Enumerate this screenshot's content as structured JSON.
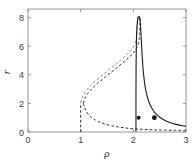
{
  "figure": {
    "background_color": "#ffffff",
    "frame_color": "#8a8a8a"
  },
  "chart_data": {
    "type": "line",
    "title": "",
    "subtitle": "",
    "xlabel": "ρ",
    "ylabel": "r",
    "xlim": [
      0,
      3
    ],
    "ylim": [
      0,
      8.6
    ],
    "xticks": [
      0,
      1,
      2,
      3
    ],
    "xtick_labels": [
      "0",
      "1",
      "2",
      "3"
    ],
    "yticks": [
      0,
      2,
      4,
      6,
      8
    ],
    "ytick_labels": [
      "0",
      "2",
      "4",
      "6",
      "8"
    ],
    "grid": false,
    "legend": null,
    "legend_position": "none",
    "colors": {
      "solid_curve": "#1a1a1a",
      "dashed_curve": "#2e2e2e",
      "dashed_curve_faint": "#7a7a7a",
      "marker": "#111111"
    },
    "series": [
      {
        "name": "upper-unstable-branch",
        "style": "dashed",
        "color": "#2e2e2e",
        "points": [
          [
            1.05,
            2.0
          ],
          [
            1.08,
            2.35
          ],
          [
            1.12,
            2.62
          ],
          [
            1.18,
            2.9
          ],
          [
            1.26,
            3.2
          ],
          [
            1.36,
            3.52
          ],
          [
            1.47,
            3.86
          ],
          [
            1.58,
            4.18
          ],
          [
            1.69,
            4.5
          ],
          [
            1.8,
            4.84
          ],
          [
            1.9,
            5.16
          ],
          [
            1.99,
            5.48
          ],
          [
            2.05,
            5.8
          ],
          [
            2.09,
            6.12
          ],
          [
            2.11,
            6.45
          ],
          [
            2.12,
            6.8
          ],
          [
            2.125,
            7.2
          ],
          [
            2.13,
            7.65
          ],
          [
            2.13,
            8.05
          ]
        ]
      },
      {
        "name": "upper-unstable-branch-secondary",
        "style": "dashed",
        "color": "#7a7a7a",
        "points": [
          [
            1.0,
            2.05
          ],
          [
            1.03,
            2.4
          ],
          [
            1.07,
            2.7
          ],
          [
            1.13,
            3.0
          ],
          [
            1.21,
            3.32
          ],
          [
            1.31,
            3.66
          ],
          [
            1.42,
            4.0
          ],
          [
            1.53,
            4.34
          ],
          [
            1.64,
            4.66
          ],
          [
            1.75,
            5.0
          ],
          [
            1.85,
            5.32
          ],
          [
            1.94,
            5.64
          ],
          [
            2.0,
            5.96
          ],
          [
            2.04,
            6.28
          ],
          [
            2.06,
            6.62
          ],
          [
            2.07,
            6.98
          ],
          [
            2.075,
            7.4
          ],
          [
            2.08,
            7.8
          ],
          [
            2.08,
            8.2
          ]
        ]
      },
      {
        "name": "lower-unstable-branch",
        "style": "dashed",
        "color": "#2e2e2e",
        "points": [
          [
            1.05,
            2.0
          ],
          [
            1.07,
            1.74
          ],
          [
            1.1,
            1.5
          ],
          [
            1.14,
            1.26
          ],
          [
            1.19,
            1.06
          ],
          [
            1.26,
            0.88
          ],
          [
            1.34,
            0.72
          ],
          [
            1.44,
            0.58
          ],
          [
            1.56,
            0.46
          ],
          [
            1.7,
            0.36
          ],
          [
            1.86,
            0.28
          ],
          [
            2.02,
            0.22
          ],
          [
            2.2,
            0.18
          ],
          [
            2.4,
            0.15
          ],
          [
            2.6,
            0.13
          ],
          [
            2.8,
            0.12
          ],
          [
            3.0,
            0.11
          ]
        ]
      },
      {
        "name": "zero-branch-dashed",
        "style": "dashed",
        "color": "#2e2e2e",
        "points": [
          [
            1.0,
            0.0
          ],
          [
            1.0,
            2.05
          ]
        ]
      },
      {
        "name": "stable-branch-solid",
        "style": "solid",
        "color": "#1a1a1a",
        "points": [
          [
            2.05,
            0.05
          ],
          [
            2.05,
            2.6
          ],
          [
            2.052,
            4.4
          ],
          [
            2.056,
            5.8
          ],
          [
            2.062,
            6.8
          ],
          [
            2.072,
            7.5
          ],
          [
            2.086,
            7.92
          ],
          [
            2.102,
            8.08
          ],
          [
            2.118,
            8.0
          ],
          [
            2.132,
            7.6
          ],
          [
            2.145,
            6.9
          ],
          [
            2.156,
            6.1
          ],
          [
            2.168,
            5.3
          ],
          [
            2.182,
            4.55
          ],
          [
            2.2,
            3.85
          ],
          [
            2.222,
            3.22
          ],
          [
            2.25,
            2.68
          ],
          [
            2.285,
            2.22
          ],
          [
            2.325,
            1.85
          ],
          [
            2.375,
            1.52
          ],
          [
            2.43,
            1.26
          ],
          [
            2.495,
            1.05
          ],
          [
            2.57,
            0.87
          ],
          [
            2.655,
            0.72
          ],
          [
            2.75,
            0.6
          ],
          [
            2.855,
            0.5
          ],
          [
            2.93,
            0.44
          ],
          [
            3.0,
            0.4
          ]
        ]
      }
    ],
    "markers": [
      {
        "name": "marker-left",
        "x": 2.1,
        "y": 1.0,
        "size": 2.0,
        "color": "#111111"
      },
      {
        "name": "marker-right",
        "x": 2.4,
        "y": 1.0,
        "size": 2.4,
        "color": "#111111"
      }
    ],
    "annotations": []
  }
}
